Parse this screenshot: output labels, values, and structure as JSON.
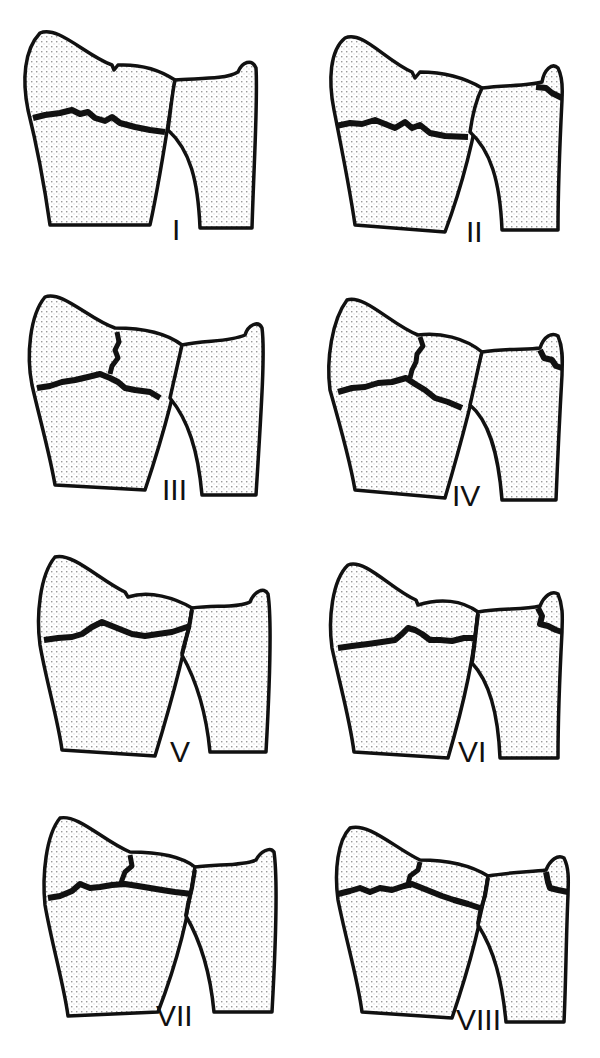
{
  "figure": {
    "title": "",
    "colors": {
      "outline": "#111111",
      "stipple": "#9a9a9a",
      "background": "#ffffff"
    },
    "panels": [
      {
        "label": "I",
        "radius_fracture": "transverse",
        "radiocarpal_split": false,
        "druj_split": false,
        "ulnar_styloid_fracture": false
      },
      {
        "label": "II",
        "radius_fracture": "transverse",
        "radiocarpal_split": false,
        "druj_split": false,
        "ulnar_styloid_fracture": true
      },
      {
        "label": "III",
        "radius_fracture": "transverse",
        "radiocarpal_split": true,
        "druj_split": false,
        "ulnar_styloid_fracture": false
      },
      {
        "label": "IV",
        "radius_fracture": "transverse",
        "radiocarpal_split": true,
        "druj_split": false,
        "ulnar_styloid_fracture": true
      },
      {
        "label": "V",
        "radius_fracture": "transverse",
        "radiocarpal_split": false,
        "druj_split": true,
        "ulnar_styloid_fracture": false
      },
      {
        "label": "VI",
        "radius_fracture": "transverse",
        "radiocarpal_split": false,
        "druj_split": true,
        "ulnar_styloid_fracture": true
      },
      {
        "label": "VII",
        "radius_fracture": "transverse",
        "radiocarpal_split": true,
        "druj_split": true,
        "ulnar_styloid_fracture": false
      },
      {
        "label": "VIII",
        "radius_fracture": "transverse",
        "radiocarpal_split": true,
        "druj_split": true,
        "ulnar_styloid_fracture": true
      }
    ]
  }
}
